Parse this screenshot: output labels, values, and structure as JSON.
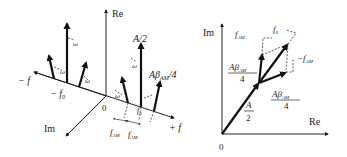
{
  "left_diagram": {
    "title": "3D spectrum (Re, Im, f)",
    "axes": {
      "re_label": "Re",
      "im_label": "Im",
      "f_pos_label": "+ f",
      "f_neg_label": "− f",
      "origin_label": "0"
    },
    "labels": {
      "neg_carrier": "− f",
      "neg_carrier_sub": "0",
      "pos_carrier": "f",
      "pos_carrier_sub": "0",
      "carrier_amp": "A/2",
      "sideband_amp_main": "Aβ",
      "sideband_amp_sub": "AM",
      "sideband_amp_tail": "/4",
      "fam_left": "f",
      "fam_left_sub": "AM",
      "fam_right": "f",
      "fam_right_sub": "AM",
      "rotation_symbol": "ω"
    }
  },
  "right_diagram": {
    "title": "Phasor sum",
    "axes": {
      "re_label": "Re",
      "im_label": "Im",
      "origin_label": "0"
    },
    "labels": {
      "carrier_num": "A",
      "carrier_den": "2",
      "upper_num_main": "Aβ",
      "upper_num_sub": "AM",
      "upper_den": "4",
      "lower_num_main": "Aβ",
      "lower_num_sub": "AM",
      "lower_den": "4",
      "f0": "f",
      "f0_sub": "0",
      "fam_top": "f",
      "fam_top_sub": "AM",
      "neg_fam": "−f",
      "neg_fam_sub": "AM"
    }
  }
}
